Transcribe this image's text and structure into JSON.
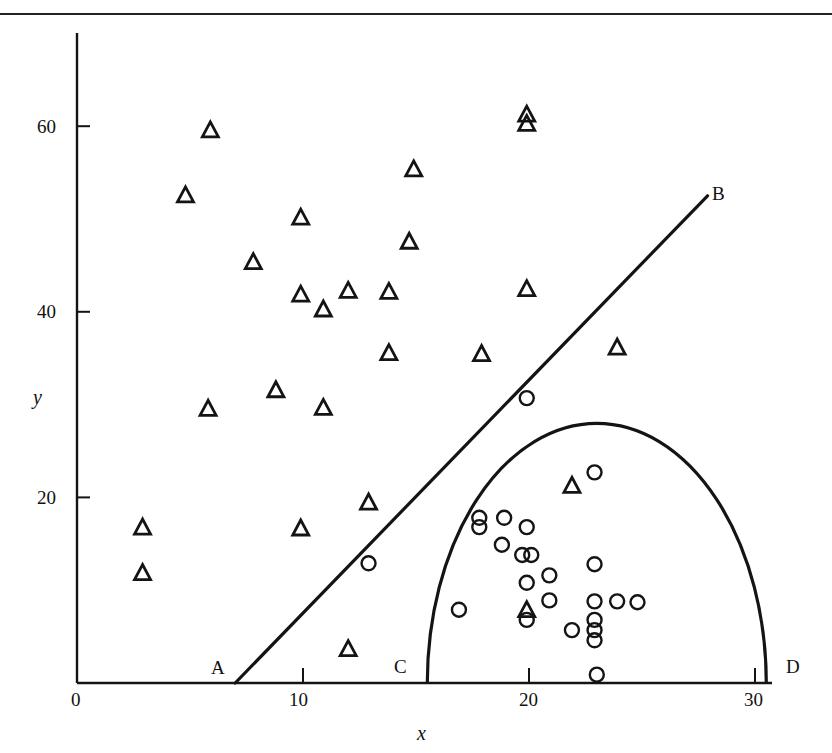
{
  "chart_data": {
    "type": "scatter",
    "title": "",
    "xlabel": "x",
    "ylabel": "y",
    "xlim": [
      0,
      31
    ],
    "ylim": [
      0,
      70
    ],
    "x_ticks": [
      0,
      10,
      20,
      30
    ],
    "y_ticks": [
      20,
      40,
      60
    ],
    "grid": false,
    "legend": null,
    "series": [
      {
        "name": "triangles",
        "marker": "triangle",
        "points": [
          [
            5.9,
            59.6
          ],
          [
            4.8,
            52.6
          ],
          [
            7.8,
            45.4
          ],
          [
            9.9,
            50.2
          ],
          [
            9.9,
            41.9
          ],
          [
            10.9,
            40.3
          ],
          [
            12.0,
            42.3
          ],
          [
            13.8,
            42.2
          ],
          [
            14.9,
            55.4
          ],
          [
            14.7,
            47.6
          ],
          [
            13.8,
            35.6
          ],
          [
            17.9,
            35.5
          ],
          [
            19.9,
            61.3
          ],
          [
            19.9,
            60.3
          ],
          [
            19.9,
            42.5
          ],
          [
            23.9,
            36.2
          ],
          [
            5.8,
            29.6
          ],
          [
            8.8,
            31.6
          ],
          [
            10.9,
            29.7
          ],
          [
            12.9,
            19.5
          ],
          [
            9.9,
            16.7
          ],
          [
            2.9,
            16.8
          ],
          [
            2.9,
            11.9
          ],
          [
            12.0,
            3.7
          ],
          [
            21.9,
            21.3
          ],
          [
            19.9,
            7.9
          ]
        ]
      },
      {
        "name": "circles",
        "marker": "circle",
        "points": [
          [
            19.9,
            30.7
          ],
          [
            12.9,
            12.9
          ],
          [
            17.8,
            17.8
          ],
          [
            17.8,
            16.8
          ],
          [
            18.9,
            17.8
          ],
          [
            19.9,
            16.8
          ],
          [
            18.8,
            14.9
          ],
          [
            19.7,
            13.8
          ],
          [
            20.1,
            13.8
          ],
          [
            19.9,
            10.8
          ],
          [
            20.9,
            11.6
          ],
          [
            20.9,
            8.9
          ],
          [
            16.9,
            7.9
          ],
          [
            19.9,
            6.8
          ],
          [
            21.9,
            5.7
          ],
          [
            22.9,
            22.7
          ],
          [
            22.9,
            12.8
          ],
          [
            22.9,
            8.8
          ],
          [
            23.9,
            8.8
          ],
          [
            24.8,
            8.7
          ],
          [
            22.9,
            6.8
          ],
          [
            22.9,
            5.7
          ],
          [
            22.9,
            4.6
          ],
          [
            23.0,
            0.9
          ]
        ]
      }
    ],
    "annotations": {
      "line_AB": {
        "from": [
          7.0,
          0
        ],
        "to": [
          27.9,
          52.5
        ],
        "labels": [
          "A",
          "B"
        ]
      },
      "semicircle_CD": {
        "center": [
          23.0,
          0
        ],
        "rx": 7.5,
        "ry": 28,
        "labels": [
          "C",
          "D"
        ]
      }
    }
  },
  "axes": {
    "x_title": "x",
    "y_title": "y",
    "x_tick_labels": [
      "0",
      "10",
      "20",
      "30"
    ],
    "y_tick_labels": [
      "20",
      "40",
      "60"
    ]
  },
  "point_labels": {
    "A": "A",
    "B": "B",
    "C": "C",
    "D": "D"
  }
}
